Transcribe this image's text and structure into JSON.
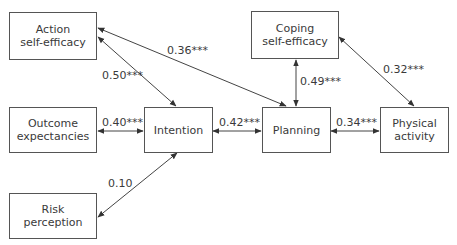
{
  "nodes": {
    "action_self_efficacy": {
      "line1": "Action",
      "line2": "self-efficacy"
    },
    "outcome_expectancies": {
      "line1": "Outcome",
      "line2": "expectancies"
    },
    "risk_perception": {
      "line1": "Risk",
      "line2": "perception"
    },
    "intention": {
      "line1": "Intention"
    },
    "planning": {
      "line1": "Planning"
    },
    "coping_self_efficacy": {
      "line1": "Coping",
      "line2": "self-efficacy"
    },
    "physical_activity": {
      "line1": "Physical",
      "line2": "activity"
    }
  },
  "edges": {
    "action_to_intention": "0.50***",
    "action_to_planning": "0.36***",
    "outcome_to_intention": "0.40***",
    "risk_to_intention": "0.10",
    "intention_to_planning": "0.42***",
    "coping_to_planning": "0.49***",
    "coping_to_physical": "0.32***",
    "planning_to_physical": "0.34***"
  },
  "colors": {
    "line": "#444444",
    "border": "#555555",
    "text": "#3a3a3a"
  }
}
